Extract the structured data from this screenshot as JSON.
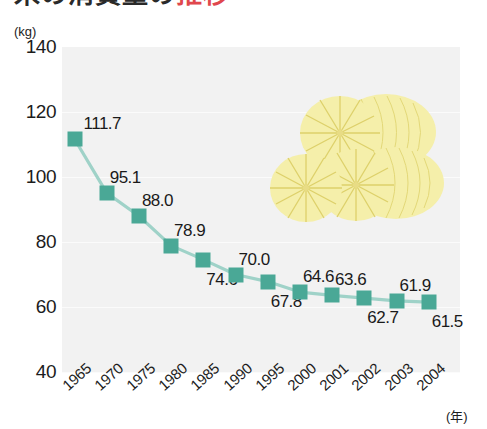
{
  "title": {
    "text_dark": "米の消費量の",
    "text_red": "推移",
    "cropped": true
  },
  "chart_data": {
    "type": "line",
    "title": "",
    "xlabel": "(年)",
    "ylabel": "(kg)",
    "categories": [
      "1965",
      "1970",
      "1975",
      "1980",
      "1985",
      "1990",
      "1995",
      "2000",
      "2001",
      "2002",
      "2003",
      "2004"
    ],
    "values": [
      111.7,
      95.1,
      88.0,
      78.9,
      74.6,
      70.0,
      67.8,
      64.6,
      63.6,
      62.7,
      61.9,
      61.5
    ],
    "label_positions": [
      "above",
      "above",
      "above",
      "above",
      "below",
      "above",
      "below",
      "above",
      "above",
      "below",
      "above",
      "below"
    ],
    "ylim": [
      40,
      140
    ],
    "yticks": [
      140,
      120,
      100,
      80,
      60,
      40
    ],
    "grid": true,
    "legend": "none",
    "series_color": "#4aa896",
    "line_color": "#9fd2c8",
    "plot_background": "#f2f2f2"
  },
  "axes": {
    "y_unit": "(kg)",
    "x_unit": "(年)",
    "y_ticks": [
      "140",
      "120",
      "100",
      "80",
      "60",
      "40"
    ],
    "x_ticks": [
      "1965",
      "1970",
      "1975",
      "1980",
      "1985",
      "1990",
      "1995",
      "2000",
      "2001",
      "2002",
      "2003",
      "2004"
    ]
  },
  "decoration": {
    "name": "rice-bales-illustration",
    "fill": "#f5efaa",
    "spoke": "#e3d878"
  }
}
